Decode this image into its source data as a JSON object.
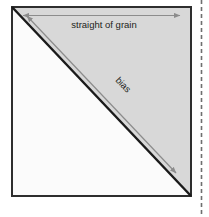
{
  "figure": {
    "title_text": "straight of grain",
    "diagonal_label_text": "bias",
    "colors": {
      "square_border": "#2e2e2e",
      "upper_triangle_fill": "#d8d8d8",
      "lower_triangle_fill": "#fbfbfb",
      "diagonal_line": "#1a1a1a",
      "arrow_gray": "#8c8c8c",
      "dashed_line": "#6f6f6f",
      "text": "#231f20",
      "page_background": "#ffffff"
    },
    "geometry": {
      "square_left": 11,
      "square_top": 6,
      "square_right": 192,
      "square_bottom": 197,
      "grain_arrow_y": 15,
      "dashed_line_x": 201
    },
    "labels": {
      "grain_arrow_name": "straight-of-grain-arrow",
      "bias_arrow_name": "bias-arrow",
      "fabric_square_name": "fabric-square",
      "diagonal_name": "bias-diagonal-fold-line",
      "dashed_name": "page-edge-dashed-rule"
    }
  }
}
